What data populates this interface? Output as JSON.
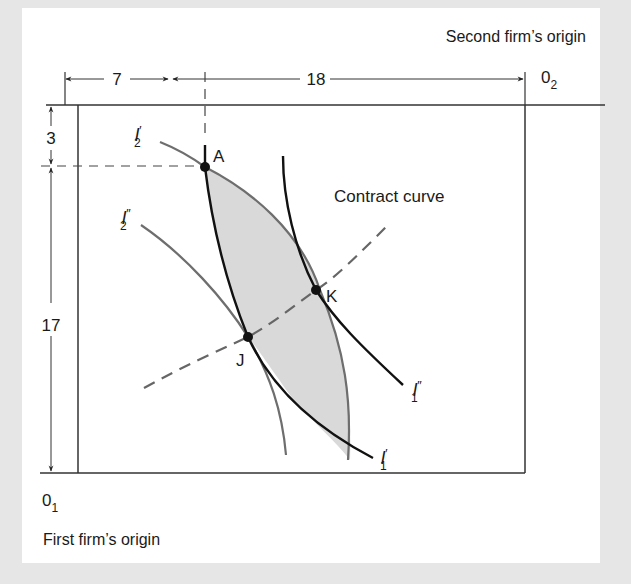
{
  "figure": {
    "type": "edgeworth-box-production",
    "labels": {
      "second_origin_caption": "Second firm’s origin",
      "second_origin_symbol": "0",
      "second_origin_sub": "2",
      "first_origin_caption": "First firm’s  origin",
      "first_origin_symbol": "0",
      "first_origin_sub": "1",
      "contract_curve": "Contract curve"
    },
    "dimensions": {
      "top_left_width": "7",
      "top_right_width": "18",
      "left_top_height": "3",
      "left_bottom_height": "17"
    },
    "points": [
      {
        "id": "A",
        "label": "A"
      },
      {
        "id": "J",
        "label": "J"
      },
      {
        "id": "K",
        "label": "K"
      }
    ],
    "isoquants": [
      {
        "id": "I2p",
        "base": "I",
        "prime": "′",
        "sub": "2",
        "firm": 2
      },
      {
        "id": "I2pp",
        "base": "I",
        "prime": "″",
        "sub": "2",
        "firm": 2
      },
      {
        "id": "I1p",
        "base": "I",
        "prime": "′",
        "sub": "1",
        "firm": 1
      },
      {
        "id": "I1pp",
        "base": "I",
        "prime": "″",
        "sub": "1",
        "firm": 1
      }
    ],
    "colors": {
      "background": "#e6e6e6",
      "panel": "#ffffff",
      "firm1_curves": "#111111",
      "firm2_curves": "#6e6e6e",
      "lens_fill": "#d8d8d8",
      "contract_curve": "#666666",
      "frame": "#333333"
    }
  }
}
